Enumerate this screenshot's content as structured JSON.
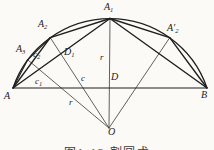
{
  "figure": {
    "caption": "图1-13 割圆术",
    "colors": {
      "chord_stroke": "#1f1f1f",
      "radius_stroke": "#3a3a3a",
      "background": "#fbfaf7"
    },
    "labels": {
      "A": {
        "base": "A"
      },
      "B": {
        "base": "B"
      },
      "A1": {
        "base": "A",
        "sub": "1"
      },
      "A2": {
        "base": "A",
        "sub": "2"
      },
      "A3": {
        "base": "A",
        "sub": "3"
      },
      "A2prime": {
        "base": "A′",
        "sub": "2"
      },
      "O": {
        "base": "O"
      },
      "D": {
        "base": "D"
      },
      "D1": {
        "base": "D",
        "sub": "1"
      },
      "c": {
        "base": "c"
      },
      "c1": {
        "base": "c",
        "sub": "1"
      },
      "c2": {
        "base": "c",
        "sub": "2"
      },
      "r_vertical": {
        "base": "r"
      },
      "r_left": {
        "base": "r"
      }
    }
  }
}
